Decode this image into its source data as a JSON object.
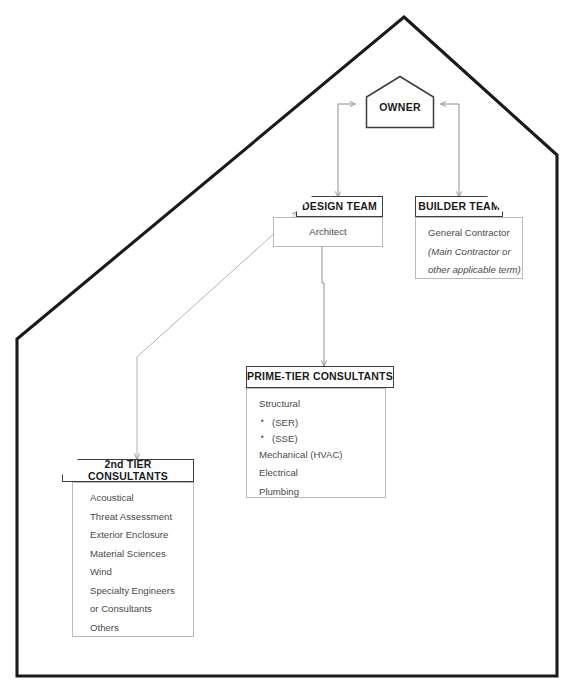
{
  "diagram": {
    "frame_shape": "house-outline",
    "nodes": {
      "owner": {
        "label": "OWNER",
        "shape": "house"
      },
      "design_team": {
        "header": "DESIGN TEAM",
        "corner": "clip-top-left",
        "body": [
          {
            "text": "Architect",
            "style": "normal"
          }
        ]
      },
      "builder_team": {
        "header": "BUILDER TEAM",
        "corner": "clip-top-right",
        "body": [
          {
            "text": "General Contractor",
            "style": "normal"
          },
          {
            "text": "(Main Contractor or",
            "style": "italic"
          },
          {
            "text": "other applicable term)",
            "style": "italic"
          }
        ]
      },
      "prime_tier": {
        "header": "PRIME-TIER CONSULTANTS",
        "corner": "none",
        "body": [
          {
            "text": "Structural",
            "style": "normal"
          },
          {
            "text": "(SER)",
            "style": "bullet"
          },
          {
            "text": "(SSE)",
            "style": "bullet"
          },
          {
            "text": "Mechanical (HVAC)",
            "style": "normal"
          },
          {
            "text": "Electrical",
            "style": "normal"
          },
          {
            "text": "Plumbing",
            "style": "normal"
          }
        ]
      },
      "second_tier": {
        "header": "2nd TIER CONSULTANTS",
        "corner": "clip-top-left",
        "body": [
          {
            "text": "Acoustical",
            "style": "normal"
          },
          {
            "text": "Threat Assessment",
            "style": "normal"
          },
          {
            "text": "Exterior Enclosure",
            "style": "normal"
          },
          {
            "text": "Material Sciences",
            "style": "normal"
          },
          {
            "text": "Wind",
            "style": "normal"
          },
          {
            "text": "Specialty Engineers",
            "style": "normal"
          },
          {
            "text": "or Consultants",
            "style": "normal"
          },
          {
            "text": "Others",
            "style": "normal"
          }
        ]
      }
    },
    "connectors": [
      {
        "from": "owner",
        "to": "design_team",
        "arrows": "both"
      },
      {
        "from": "owner",
        "to": "builder_team",
        "arrows": "both"
      },
      {
        "from": "design_team",
        "to": "prime_tier",
        "arrows": "end"
      },
      {
        "from": "design_team",
        "to": "second_tier",
        "arrows": "both"
      }
    ],
    "colors": {
      "outline": "#1a1a1a",
      "header_border": "#3c3c3c",
      "body_border": "#b9b9b9",
      "connector": "#8e8e8e",
      "text": "#4a4a4a",
      "header_text": "#1b1b1b"
    }
  },
  "caption": {
    "figure_number": "",
    "text": ""
  }
}
